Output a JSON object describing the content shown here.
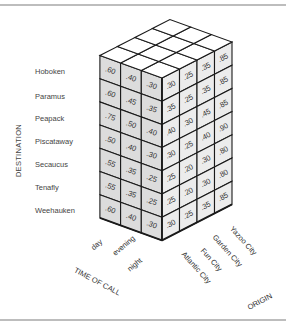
{
  "axes": {
    "destination": "DESTINATION",
    "time_of_call": "TIME OF CALL",
    "origin": "ORIGIN"
  },
  "destinations": [
    "Hoboken",
    "Paramus",
    "Peapack",
    "Piscataway",
    "Secaucus",
    "Tenafly",
    "Weehauken"
  ],
  "time_of_call": [
    "day",
    "evening",
    "night"
  ],
  "origins": [
    "Atlantic City",
    "Fun City",
    "Garden City",
    "Yazoo City"
  ],
  "left_face_values": [
    [
      ".60",
      ".40",
      ".30"
    ],
    [
      ".60",
      ".45",
      ".35"
    ],
    [
      ".75",
      ".50",
      ".40"
    ],
    [
      ".50",
      ".40",
      ".30"
    ],
    [
      ".55",
      ".35",
      ".25"
    ],
    [
      ".55",
      ".35",
      ".25"
    ],
    [
      ".60",
      ".40",
      ".30"
    ]
  ],
  "right_face_values": [
    [
      ".30",
      ".25",
      ".35",
      ".85"
    ],
    [
      ".35",
      ".25",
      ".35",
      ".85"
    ],
    [
      ".40",
      ".30",
      ".45",
      ".85"
    ],
    [
      ".30",
      ".25",
      ".40",
      ".90"
    ],
    [
      ".25",
      ".20",
      ".30",
      ".80"
    ],
    [
      ".25",
      ".20",
      ".30",
      ".80"
    ],
    [
      ".30",
      ".25",
      ".35",
      ".85"
    ]
  ],
  "colors": {
    "left_face": "#dcdcdc",
    "right_face": "#ececec",
    "top_face": "#ffffff",
    "lines": "#1a1a1a"
  }
}
